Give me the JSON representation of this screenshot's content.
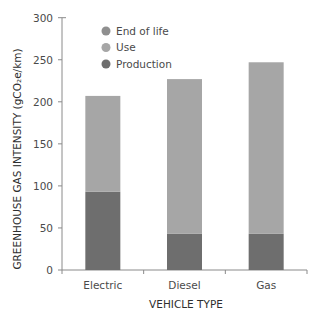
{
  "chart_data": {
    "type": "bar",
    "stacked": true,
    "title": "",
    "xlabel": "VEHICLE TYPE",
    "ylabel": "GREENHOUSE GAS INTENSITY (gCO₂e/km)",
    "ylim": [
      0,
      300
    ],
    "yticks": [
      0,
      50,
      100,
      150,
      200,
      250,
      300
    ],
    "grid": false,
    "legend_position": "top-left inside",
    "categories": [
      "Electric",
      "Diesel",
      "Gas"
    ],
    "series": [
      {
        "name": "Production",
        "color": "#6e6e6e",
        "values": [
          93,
          43,
          43
        ]
      },
      {
        "name": "Use",
        "color": "#a6a6a6",
        "values": [
          114,
          184,
          204
        ]
      },
      {
        "name": "End of life",
        "color": "#8f8f8f",
        "values": [
          0,
          0,
          0
        ]
      }
    ],
    "totals": [
      207,
      227,
      247
    ],
    "legend": [
      "End of life",
      "Use",
      "Production"
    ]
  }
}
